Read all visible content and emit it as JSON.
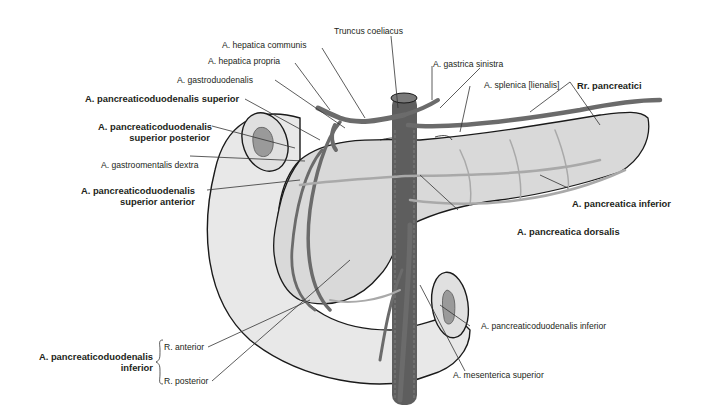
{
  "figure": {
    "colors": {
      "background": "#ffffff",
      "organ_fill": "#e6e6e6",
      "organ_fill_dark": "#d6d6d6",
      "artery": "#6b6b6b",
      "artery_light": "#a9a9a9",
      "aorta": "#5e5e5e",
      "outline": "#1a1a1a",
      "lumen": "#9a9a9a",
      "leader_line": "#333333",
      "text": "#231f20"
    }
  },
  "labels": {
    "truncus_coeliacus": "Truncus coeliacus",
    "hepatica_communis": "A. hepatica communis",
    "hepatica_propria": "A. hepatica propria",
    "gastrica_sinistra": "A. gastrica sinistra",
    "gastroduodenalis": "A. gastroduodenalis",
    "splenica": "A. splenica [lienalis]",
    "rr_pancreatici": "Rr. pancreatici",
    "pd_superior": "A. pancreaticoduodenalis superior",
    "pd_superior_posterior_1": "A. pancreaticoduodenalis",
    "pd_superior_posterior_2": "superior posterior",
    "gastroomentalis_dextra": "A. gastroomentalis dextra",
    "pd_superior_anterior_1": "A. pancreaticoduodenalis",
    "pd_superior_anterior_2": "superior anterior",
    "pancreatica_inferior": "A. pancreatica inferior",
    "pancreatica_dorsalis": "A. pancreatica dorsalis",
    "pd_inferior_right": "A. pancreaticoduodenalis inferior",
    "mesenterica_superior": "A. mesenterica superior",
    "pd_inferior_group_1": "A. pancreaticoduodenalis",
    "pd_inferior_group_2": "inferior",
    "r_anterior": "R. anterior",
    "r_posterior": "R. posterior"
  }
}
